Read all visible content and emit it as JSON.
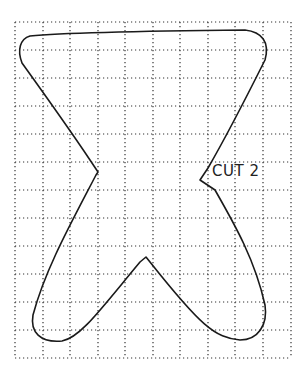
{
  "diagram": {
    "type": "sewing-pattern-piece",
    "label": "CUT 2",
    "grid": {
      "style": "dotted",
      "x_lines": [
        15,
        43,
        70,
        98,
        125,
        153,
        180,
        208,
        235,
        263,
        291
      ],
      "y_lines": [
        22,
        50,
        78,
        106,
        134,
        162,
        190,
        218,
        246,
        274,
        302,
        330,
        358
      ],
      "color": "#333333"
    },
    "outline": {
      "color": "#1a1a1a",
      "path": "M30 36 C60 33 150 31 245 30 C262 32 270 42 265 60 C250 90 230 130 208 168 L200 180 L215 190 C235 225 255 260 265 305 C268 325 258 340 240 340 C215 338 200 325 150 262 L146 257 L140 262 C100 310 80 338 62 341 C40 343 30 332 33 315 C45 270 70 225 96 175 L98 172 L90 160 C70 130 45 95 22 63 C17 50 20 39 30 36 Z"
    }
  }
}
